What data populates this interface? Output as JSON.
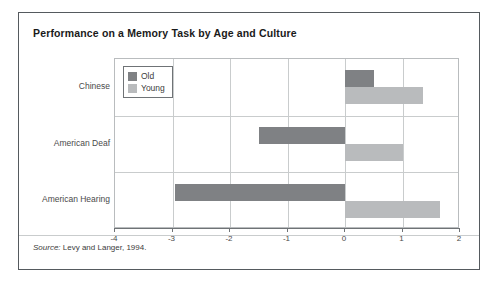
{
  "figure": {
    "title": "Performance on a Memory Task by Age and Culture",
    "source_label": "Source:",
    "source_text": " Levy and Langer, 1994."
  },
  "legend": {
    "position": "inside-top-left",
    "items": [
      {
        "label": "Old",
        "color": "#7f8184"
      },
      {
        "label": "Young",
        "color": "#b9bbbd"
      }
    ]
  },
  "axis": {
    "x_ticks": [
      "-4",
      "-3",
      "-2",
      "-1",
      "0",
      "1",
      "2"
    ],
    "y_categories": [
      "Chinese",
      "American Deaf",
      "American Hearing"
    ]
  },
  "chart_data": {
    "type": "bar",
    "orientation": "horizontal",
    "title": "Performance on a Memory Task by Age and Culture",
    "xlabel": "",
    "ylabel": "",
    "xlim": [
      -4,
      2
    ],
    "xticks": [
      -4,
      -3,
      -2,
      -1,
      0,
      1,
      2
    ],
    "grid": true,
    "legend_position": "inside-top-left",
    "categories": [
      "Chinese",
      "American Deaf",
      "American Hearing"
    ],
    "series": [
      {
        "name": "Old",
        "color": "#7f8184",
        "values": [
          0.5,
          -1.5,
          -2.95
        ]
      },
      {
        "name": "Young",
        "color": "#b9bbbd",
        "values": [
          1.35,
          1.0,
          1.65
        ]
      }
    ],
    "annotations": [
      "Source: Levy and Langer, 1994."
    ]
  }
}
